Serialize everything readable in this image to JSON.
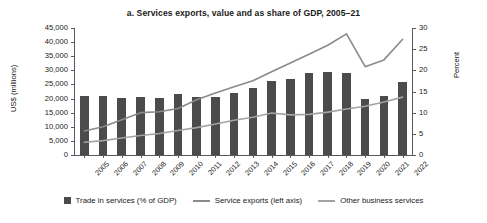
{
  "chart_data": {
    "type": "bar",
    "title": "a. Services exports, value and as share of GDP, 2005–21",
    "xlabel": "",
    "ylabel": "US$ (millions)",
    "ylabel_right": "Percent",
    "ylim": [
      0,
      45000
    ],
    "ylim_right": [
      0,
      30
    ],
    "yticks": [
      "0",
      "5,000",
      "10,000",
      "15,000",
      "20,000",
      "25,000",
      "30,000",
      "35,000",
      "40,000",
      "45,000"
    ],
    "ytick_values": [
      0,
      5000,
      10000,
      15000,
      20000,
      25000,
      30000,
      35000,
      40000,
      45000
    ],
    "yticks_right": [
      "0",
      "5",
      "10",
      "15",
      "20",
      "25",
      "30"
    ],
    "ytick_values_right": [
      0,
      5,
      10,
      15,
      20,
      25,
      30
    ],
    "grid": false,
    "legend_position": "bottom",
    "categories": [
      "2005",
      "2006",
      "2007",
      "2008",
      "2009",
      "2010",
      "2011",
      "2012",
      "2013",
      "2014",
      "2015",
      "2016",
      "2017",
      "2018",
      "2019",
      "2020",
      "2021",
      "2022"
    ],
    "series": [
      {
        "name": "Trade in services (% of GDP)",
        "type": "bar",
        "axis": "left",
        "color": "#4b4b4d",
        "values": [
          20800,
          20800,
          20300,
          20400,
          20100,
          21500,
          20500,
          20400,
          22000,
          23900,
          26400,
          27100,
          29000,
          29300,
          28900,
          19900,
          20800,
          26000
        ]
      },
      {
        "name": "Service exports (left axis)",
        "type": "line",
        "axis": "left",
        "color": "#8a8a8c",
        "values": [
          8500,
          10000,
          12500,
          15000,
          15300,
          16500,
          19600,
          22000,
          24200,
          26300,
          29500,
          32600,
          35700,
          38900,
          42900,
          31300,
          33700,
          41000
        ]
      },
      {
        "name": "Other business services",
        "type": "line",
        "axis": "left",
        "color": "#a3a3a5",
        "values": [
          4500,
          5100,
          6000,
          6900,
          7600,
          8700,
          9700,
          11000,
          12300,
          13400,
          14900,
          14200,
          14400,
          15200,
          16300,
          17300,
          18800,
          20500
        ]
      }
    ]
  }
}
